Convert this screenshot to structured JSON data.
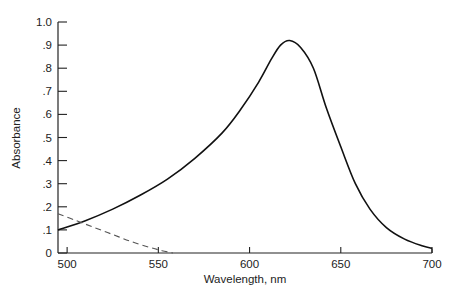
{
  "chart_data": {
    "type": "line",
    "title": "",
    "xlabel": "Wavelength, nm",
    "ylabel": "Absorbance",
    "xlim": [
      495,
      700
    ],
    "ylim": [
      0,
      1.0
    ],
    "grid": false,
    "legend": null,
    "x_ticks": [
      500,
      550,
      600,
      650,
      700
    ],
    "x_tick_labels": [
      "500",
      "550",
      "600",
      "650",
      "700"
    ],
    "y_ticks": [
      0,
      0.1,
      0.2,
      0.3,
      0.4,
      0.5,
      0.6,
      0.7,
      0.8,
      0.9,
      1.0
    ],
    "y_tick_labels": [
      "0",
      ".1",
      ".2",
      ".3",
      ".4",
      ".5",
      ".6",
      ".7",
      ".8",
      ".9",
      "1.0"
    ],
    "series": [
      {
        "name": "absorbance-solid",
        "style": "solid",
        "color": "#111111",
        "x": [
          495,
          510,
          525,
          540,
          555,
          570,
          585,
          595,
          605,
          612,
          617,
          622,
          628,
          635,
          642,
          650,
          658,
          666,
          675,
          685,
          695,
          700
        ],
        "y": [
          0.1,
          0.14,
          0.19,
          0.25,
          0.32,
          0.41,
          0.52,
          0.62,
          0.74,
          0.84,
          0.9,
          0.92,
          0.89,
          0.8,
          0.63,
          0.46,
          0.3,
          0.19,
          0.11,
          0.06,
          0.03,
          0.02
        ]
      },
      {
        "name": "absorbance-dashed",
        "style": "dashed",
        "color": "#555555",
        "x": [
          495,
          505,
          515,
          525,
          535,
          545,
          552,
          558
        ],
        "y": [
          0.17,
          0.14,
          0.11,
          0.08,
          0.05,
          0.025,
          0.01,
          0.0
        ]
      }
    ]
  }
}
